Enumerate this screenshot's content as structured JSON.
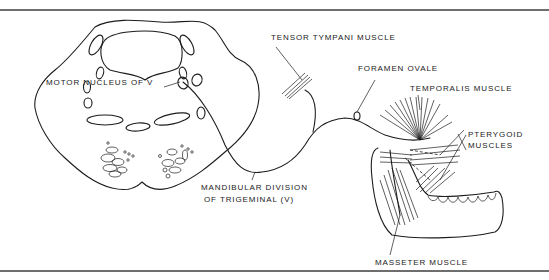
{
  "figure": {
    "labels": {
      "motor_nucleus": "MOTOR NUCLEUS OF V",
      "tensor_tympani": "TENSOR TYMPANI MUSCLE",
      "foramen_ovale": "FORAMEN OVALE",
      "temporalis": "TEMPORALIS MUSCLE",
      "pterygoid_line1": "PTERYGOID",
      "pterygoid_line2": "MUSCLES",
      "mandibular_line1": "MANDIBULAR DIVISION",
      "mandibular_line2": "OF TRIGEMINAL (V)",
      "masseter": "MASSETER MUSCLE"
    },
    "colors": {
      "line": "#1c1c1c",
      "rule": "#6e6e6e",
      "background": "#ffffff"
    }
  }
}
